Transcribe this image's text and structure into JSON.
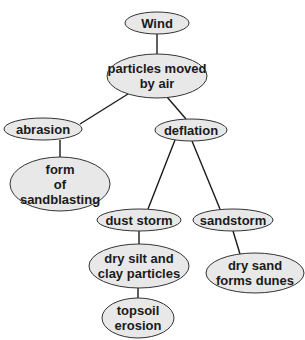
{
  "diagram": {
    "type": "concept-map",
    "nodes": [
      {
        "id": "wind",
        "lines": [
          "Wind"
        ],
        "cx": 157,
        "cy": 23,
        "rx": 32,
        "ry": 11
      },
      {
        "id": "particles",
        "lines": [
          "particles moved",
          "by air"
        ],
        "cx": 157,
        "cy": 76,
        "rx": 50,
        "ry": 22
      },
      {
        "id": "abrasion",
        "lines": [
          "abrasion"
        ],
        "cx": 43,
        "cy": 129,
        "rx": 39,
        "ry": 11
      },
      {
        "id": "deflation",
        "lines": [
          "deflation"
        ],
        "cx": 191,
        "cy": 130,
        "rx": 36,
        "ry": 11
      },
      {
        "id": "sandblasting",
        "lines": [
          "form",
          "of",
          "sandblasting"
        ],
        "cx": 60,
        "cy": 184,
        "rx": 50,
        "ry": 27
      },
      {
        "id": "dust_storm",
        "lines": [
          "dust storm"
        ],
        "cx": 139,
        "cy": 220,
        "rx": 42,
        "ry": 11
      },
      {
        "id": "sandstorm",
        "lines": [
          "sandstorm"
        ],
        "cx": 233,
        "cy": 220,
        "rx": 40,
        "ry": 11
      },
      {
        "id": "silt",
        "lines": [
          "dry silt and",
          "clay particles"
        ],
        "cx": 139,
        "cy": 266,
        "rx": 50,
        "ry": 22
      },
      {
        "id": "dunes",
        "lines": [
          "dry sand",
          "forms dunes"
        ],
        "cx": 255,
        "cy": 273,
        "rx": 49,
        "ry": 20
      },
      {
        "id": "topsoil",
        "lines": [
          "topsoil",
          "erosion"
        ],
        "cx": 138,
        "cy": 318,
        "rx": 36,
        "ry": 20
      }
    ],
    "edges": [
      {
        "from": "wind",
        "to": "particles",
        "x1": 157,
        "y1": 34,
        "x2": 157,
        "y2": 54
      },
      {
        "from": "particles",
        "to": "abrasion",
        "x1": 128,
        "y1": 94,
        "x2": 80,
        "y2": 124
      },
      {
        "from": "particles",
        "to": "deflation",
        "x1": 167,
        "y1": 97,
        "x2": 186,
        "y2": 119
      },
      {
        "from": "abrasion",
        "to": "sandblasting",
        "x1": 60,
        "y1": 140,
        "x2": 60,
        "y2": 157
      },
      {
        "from": "deflation",
        "to": "dust_storm",
        "x1": 175,
        "y1": 140,
        "x2": 148,
        "y2": 209
      },
      {
        "from": "deflation",
        "to": "sandstorm",
        "x1": 192,
        "y1": 141,
        "x2": 220,
        "y2": 209
      },
      {
        "from": "dust_storm",
        "to": "silt",
        "x1": 139,
        "y1": 231,
        "x2": 139,
        "y2": 244
      },
      {
        "from": "sandstorm",
        "to": "dunes",
        "x1": 233,
        "y1": 231,
        "x2": 240,
        "y2": 254
      },
      {
        "from": "silt",
        "to": "topsoil",
        "x1": 138,
        "y1": 288,
        "x2": 138,
        "y2": 298
      }
    ]
  }
}
